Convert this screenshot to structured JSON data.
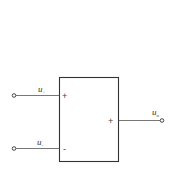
{
  "diagram": {
    "type": "block-diagram",
    "block": {
      "shape": "rectangle"
    },
    "inputs": [
      {
        "label": "u",
        "subscript": "+",
        "terminal_sign": "+"
      },
      {
        "label": "u",
        "subscript": "-",
        "terminal_sign": "-"
      }
    ],
    "output": {
      "label": "u",
      "subscript": "o",
      "terminal_sign": "+"
    },
    "colors": {
      "stroke": "#333333",
      "background": "#ffffff"
    }
  }
}
